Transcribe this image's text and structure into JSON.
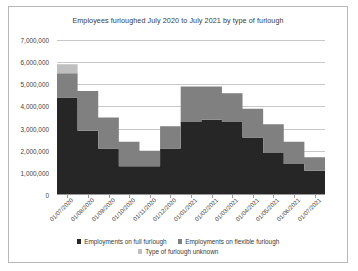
{
  "chart_data": {
    "type": "area",
    "title": "Employees furloughed July 2020 to July 2021 by type of furlough",
    "xlabel": "",
    "ylabel": "",
    "ylim": [
      0,
      7000000
    ],
    "ytick_values": [
      0,
      1000000,
      2000000,
      3000000,
      4000000,
      5000000,
      6000000,
      7000000
    ],
    "ytick_labels": [
      "0",
      "1,000,000",
      "2,000,000",
      "3,000,000",
      "4,000,000",
      "5,000,000",
      "6,000,000",
      "7,000,000"
    ],
    "grid": true,
    "stacked": true,
    "step": true,
    "legend_position": "bottom",
    "categories": [
      "01/07/2020",
      "01/08/2020",
      "01/09/2020",
      "01/10/2020",
      "01/11/2020",
      "01/12/2020",
      "01/01/2021",
      "01/02/2021",
      "01/03/2021",
      "01/04/2021",
      "01/05/2021",
      "01/06/2021",
      "01/07/2021"
    ],
    "series": [
      {
        "name": "Employments on full furlough",
        "color": "#262626",
        "values": [
          4400000,
          2900000,
          2100000,
          1300000,
          1300000,
          2100000,
          3300000,
          3400000,
          3300000,
          2600000,
          1900000,
          1400000,
          1100000
        ]
      },
      {
        "name": "Employments on flexible furlough",
        "color": "#808080",
        "values": [
          1100000,
          1800000,
          1400000,
          1100000,
          700000,
          1000000,
          1600000,
          1500000,
          1300000,
          1300000,
          1300000,
          1000000,
          600000
        ]
      },
      {
        "name": "Type of furlough unknown",
        "color": "#bfbfbf",
        "values": [
          400000,
          0,
          0,
          0,
          0,
          0,
          0,
          0,
          0,
          0,
          0,
          0,
          0
        ]
      }
    ],
    "totals": [
      5900000,
      4700000,
      3500000,
      2400000,
      2000000,
      3100000,
      4900000,
      4900000,
      4600000,
      3900000,
      3200000,
      2400000,
      1700000
    ]
  },
  "legend": {
    "row1": [
      {
        "label": "Employments on full furlough",
        "color": "#262626"
      },
      {
        "label": "Employments on flexible furlough",
        "color": "#808080"
      }
    ],
    "row2": [
      {
        "label": "Type of furlough unknown",
        "color": "#bfbfbf"
      }
    ]
  }
}
